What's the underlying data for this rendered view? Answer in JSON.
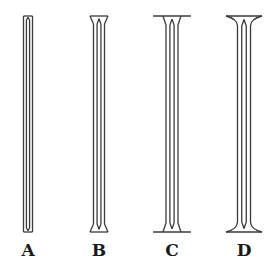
{
  "diagram": {
    "stroke_color": "#3a3a3a",
    "background": "#ffffff",
    "columns": [
      {
        "label": "A",
        "cx": 28,
        "shaft_half": 4.5,
        "cap_half": 4.5,
        "cap_h": 4,
        "flange": false
      },
      {
        "label": "B",
        "cx": 99,
        "shaft_half": 5.5,
        "cap_half": 9,
        "cap_h": 8,
        "flange": false
      },
      {
        "label": "C",
        "cx": 172,
        "shaft_half": 6,
        "cap_half": 9,
        "cap_h": 9,
        "flange": true,
        "flange_half": 19
      },
      {
        "label": "D",
        "cx": 244,
        "shaft_half": 6.5,
        "cap_half": 18,
        "cap_h": 10,
        "flange": false,
        "curved": true
      }
    ],
    "top_y": 16,
    "bottom_y": 232
  }
}
